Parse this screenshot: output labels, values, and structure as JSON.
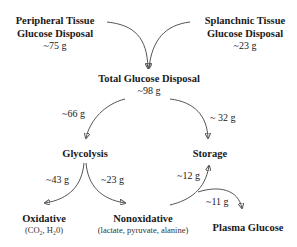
{
  "nodes": {
    "peripheral": {
      "title_line1": "Peripheral Tissue",
      "title_line2": "Glucose Disposal",
      "amount": "~75 g"
    },
    "splanchnic": {
      "title_line1": "Splanchnic Tissue",
      "title_line2": "Glucose Disposal",
      "amount": "~23 g"
    },
    "total": {
      "title": "Total Glucose Disposal",
      "amount": "~98 g"
    },
    "glycolysis": {
      "title": "Glycolysis"
    },
    "storage": {
      "title": "Storage"
    },
    "oxidative": {
      "title": "Oxidative",
      "detail": "(CO₂, H₂0)"
    },
    "nonoxidative": {
      "title": "Nonoxidative",
      "detail": "(lactate, pyruvate, alanine)"
    },
    "plasma": {
      "title": "Plasma Glucose"
    }
  },
  "edges": [
    {
      "from": "peripheral",
      "to": "total",
      "label": ""
    },
    {
      "from": "splanchnic",
      "to": "total",
      "label": ""
    },
    {
      "from": "total",
      "to": "glycolysis",
      "label": "~66 g"
    },
    {
      "from": "total",
      "to": "storage",
      "label": "~ 32 g"
    },
    {
      "from": "glycolysis",
      "to": "oxidative",
      "label": "~43 g"
    },
    {
      "from": "glycolysis",
      "to": "nonoxidative",
      "label": "~23 g"
    },
    {
      "from": "nonoxidative",
      "to": "storage",
      "label": "~12 g"
    },
    {
      "from": "nonoxidative",
      "to": "plasma",
      "label": "~11 g"
    }
  ]
}
